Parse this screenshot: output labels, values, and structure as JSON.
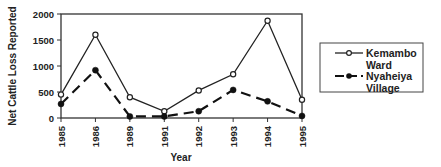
{
  "chart_data": {
    "type": "line",
    "title": "",
    "xlabel": "Year",
    "ylabel": "Net Cattle Loss Reported",
    "ylim": [
      0,
      2000
    ],
    "yticks": [
      0,
      500,
      1000,
      1500,
      2000
    ],
    "yticks_labels": [
      "0",
      "500",
      "1000",
      "1500",
      "2000"
    ],
    "categories": [
      "1985",
      "1986",
      "1989",
      "1991",
      "1992",
      "1993",
      "1994",
      "1995"
    ],
    "grid": false,
    "legend_position": "right",
    "series": [
      {
        "name": "Kemambo Ward",
        "name_lines": [
          "Kemambo",
          "Ward"
        ],
        "style": "solid",
        "marker": "open-circle",
        "color": "#222222",
        "values": [
          450,
          1600,
          400,
          130,
          530,
          840,
          1870,
          350
        ]
      },
      {
        "name": "Nyaheiya Village",
        "name_lines": [
          "Nyaheiya",
          "Village"
        ],
        "style": "dashed",
        "marker": "filled-circle",
        "color": "#111111",
        "values": [
          270,
          920,
          30,
          30,
          130,
          540,
          320,
          40
        ]
      }
    ]
  }
}
